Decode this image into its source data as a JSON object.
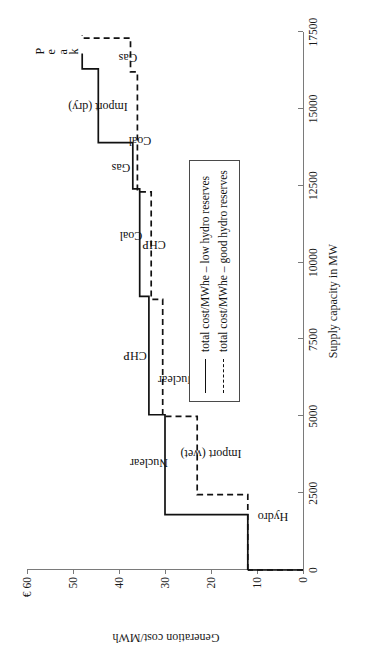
{
  "figure": {
    "rotation_note_hidden": "",
    "peak_label": "Peak",
    "peak_letters": [
      "P",
      "e",
      "a",
      "k"
    ]
  },
  "axes": {
    "x": {
      "title": "Supply capacity in MW",
      "ticks": [
        0,
        2500,
        5000,
        7500,
        10000,
        12500,
        15000,
        17500
      ],
      "tick_labels": [
        "0",
        "2500",
        "5000",
        "7500",
        "10000",
        "12500",
        "15000",
        "17500"
      ],
      "min": 0,
      "max": 17500
    },
    "y": {
      "title": "Generation cost/MWh",
      "ticks": [
        0,
        10,
        20,
        30,
        40,
        50,
        60
      ],
      "tick_labels": [
        "0",
        "10",
        "20",
        "30",
        "40",
        "50",
        "€ 60"
      ],
      "min": 0,
      "max": 60
    }
  },
  "legend": {
    "items": [
      {
        "style": "solid",
        "label": "total cost/MWhe – low hydro reserves"
      },
      {
        "style": "dashed",
        "label": "total cost/MWhe – good hydro reserves"
      }
    ]
  },
  "annotations": {
    "solid": [
      {
        "label": "Hydro",
        "x": 1750,
        "y": 6.5,
        "orientation": "vertical"
      },
      {
        "label": "Nuclear",
        "x": 3500,
        "y": 33.5,
        "orientation": "vertical"
      },
      {
        "label": "CHP",
        "x": 7000,
        "y": 36.5,
        "orientation": "vertical"
      },
      {
        "label": "Coal",
        "x": 10900,
        "y": 37.5,
        "orientation": "vertical"
      },
      {
        "label": "Gas",
        "x": 13100,
        "y": 39.5,
        "orientation": "vertical"
      },
      {
        "label": "Import (dry)",
        "x": 15100,
        "y": 44.5,
        "orientation": "vertical"
      }
    ],
    "dashed": [
      {
        "label": "Import (wet)",
        "x": 3800,
        "y": 20.0,
        "orientation": "vertical"
      },
      {
        "label": "Nuclear",
        "x": 6200,
        "y": 27.5,
        "orientation": "vertical"
      },
      {
        "label": "CHP",
        "x": 10600,
        "y": 32.5,
        "orientation": "vertical"
      },
      {
        "label": "Coal",
        "x": 14000,
        "y": 35.5,
        "orientation": "vertical"
      },
      {
        "label": "Gas",
        "x": 16700,
        "y": 38.0,
        "orientation": "vertical"
      }
    ]
  },
  "chart_data": {
    "type": "line",
    "title": "",
    "subtitle": "",
    "xlabel": "Supply capacity in MW",
    "ylabel": "Generation cost/MWh",
    "xlim": [
      0,
      17500
    ],
    "ylim": [
      0,
      60
    ],
    "grid": false,
    "legend_position": "right-inside",
    "step_style": "post",
    "series": [
      {
        "name": "total cost/MWhe – low hydro reserves",
        "style": "solid",
        "steps": [
          {
            "label": "Hydro",
            "x_start": 0,
            "x_end": 1800,
            "cost": 12.0
          },
          {
            "label": "Nuclear",
            "x_start": 1800,
            "x_end": 5050,
            "cost": 30.0
          },
          {
            "label": "CHP",
            "x_start": 5050,
            "x_end": 8900,
            "cost": 33.5
          },
          {
            "label": "Coal",
            "x_start": 8900,
            "x_end": 12400,
            "cost": 35.5
          },
          {
            "label": "Gas",
            "x_start": 12400,
            "x_end": 13900,
            "cost": 37.0
          },
          {
            "label": "Import (dry)",
            "x_start": 13900,
            "x_end": 16300,
            "cost": 44.5
          },
          {
            "label": "Peak",
            "x_start": 16300,
            "x_end": 16800,
            "cost": 48.0
          }
        ],
        "x": [
          0,
          1800,
          1800,
          5050,
          5050,
          8900,
          8900,
          12400,
          12400,
          13900,
          13900,
          16300,
          16300,
          16800
        ],
        "y": [
          12.0,
          12.0,
          30.0,
          30.0,
          33.5,
          33.5,
          35.5,
          35.5,
          37.0,
          37.0,
          44.5,
          44.5,
          48.0,
          48.0
        ]
      },
      {
        "name": "total cost/MWhe – good hydro reserves",
        "style": "dashed",
        "steps": [
          {
            "label": "Hydro",
            "x_start": 0,
            "x_end": 2450,
            "cost": 12.0
          },
          {
            "label": "Import (wet)",
            "x_start": 2450,
            "x_end": 5000,
            "cost": 23.0
          },
          {
            "label": "Nuclear",
            "x_start": 5000,
            "x_end": 8800,
            "cost": 30.5
          },
          {
            "label": "CHP",
            "x_start": 8800,
            "x_end": 12300,
            "cost": 33.0
          },
          {
            "label": "Coal",
            "x_start": 12300,
            "x_end": 16200,
            "cost": 36.0
          },
          {
            "label": "Gas",
            "x_start": 16200,
            "x_end": 17300,
            "cost": 37.5
          },
          {
            "label": "Peak",
            "x_start": 17300,
            "x_end": 17400,
            "cost": 48.0
          }
        ],
        "x": [
          0,
          2450,
          2450,
          5000,
          5000,
          8800,
          8800,
          12300,
          12300,
          16200,
          16200,
          17300,
          17300,
          17400
        ],
        "y": [
          12.0,
          12.0,
          23.0,
          23.0,
          30.5,
          30.5,
          33.0,
          33.0,
          36.0,
          36.0,
          37.5,
          37.5,
          48.0,
          48.0
        ]
      }
    ]
  }
}
